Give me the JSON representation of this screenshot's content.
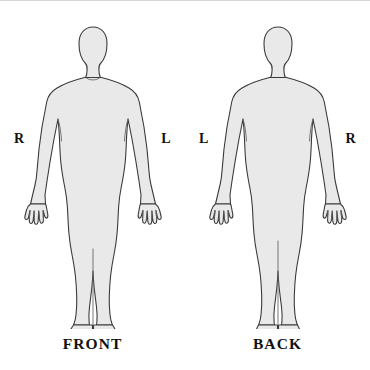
{
  "diagram": {
    "canvas": {
      "width": 370,
      "height": 370,
      "background": "#ffffff"
    },
    "style": {
      "body_fill": "#e9e9e9",
      "body_stroke": "#3a3a3a",
      "detail_stroke": "#555555",
      "text_color": "#111111",
      "stroke_width": 1.1
    },
    "figures": [
      {
        "id": "front",
        "caption": "FRONT",
        "view": "anterior",
        "labels": {
          "left": "R",
          "right": "L"
        },
        "left_label_meaning": "Right side of patient",
        "right_label_meaning": "Left side of patient"
      },
      {
        "id": "back",
        "caption": "BACK",
        "view": "posterior",
        "labels": {
          "left": "L",
          "right": "R"
        },
        "left_label_meaning": "Left side of patient",
        "right_label_meaning": "Right side of patient"
      }
    ]
  }
}
